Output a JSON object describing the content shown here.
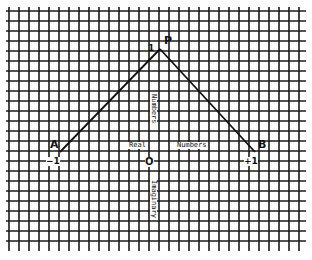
{
  "diagram": {
    "type": "graph-paper-plot",
    "grid": {
      "x_start": 9,
      "x_end": 304,
      "y_start": 9,
      "y_end": 248,
      "spacing": 10,
      "color": "#1a1a1a"
    },
    "points": {
      "A": {
        "label": "A",
        "x": 60,
        "y": 152
      },
      "P": {
        "label": "P",
        "x": 160,
        "y": 49
      },
      "B": {
        "label": "B",
        "x": 255,
        "y": 152
      }
    },
    "segments": [
      [
        "A",
        "P"
      ],
      [
        "P",
        "B"
      ]
    ],
    "axis_labels": {
      "real_left": "Real",
      "real_right": "Numbers",
      "imag_upper": "Numbers",
      "imag_lower": "Imaginary"
    },
    "tick_labels": {
      "origin": "O",
      "minus_one": "−1",
      "plus_one": "+1",
      "imag_one": "1"
    },
    "line_color": "#111111"
  }
}
